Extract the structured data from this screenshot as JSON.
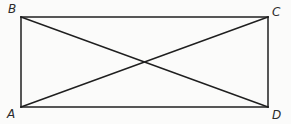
{
  "figure": {
    "type": "geometry-diagram",
    "shape": "rectangle-with-diagonals",
    "background_color": "#fbfbfa",
    "stroke_color": "#1f1f1f",
    "stroke_width": 1.4,
    "labels": {
      "top_left": "B",
      "top_right": "C",
      "bottom_left": "A",
      "bottom_right": "D"
    },
    "vertices": {
      "B": {
        "x": 21,
        "y": 17
      },
      "C": {
        "x": 268,
        "y": 17
      },
      "A": {
        "x": 21,
        "y": 107
      },
      "D": {
        "x": 268,
        "y": 107
      }
    },
    "diagonals": [
      {
        "name": "AC",
        "from": "A",
        "to": "C"
      },
      {
        "name": "BD",
        "from": "B",
        "to": "D"
      }
    ],
    "intersection": {
      "x": 144.5,
      "y": 62
    }
  }
}
